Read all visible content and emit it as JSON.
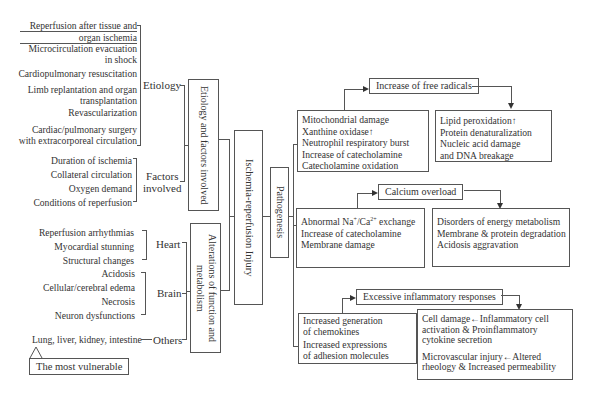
{
  "etiology": {
    "label": "Etiology",
    "items": [
      [
        "Reperfusion after tissue and",
        "organ ischemia"
      ],
      [
        "Microcirculation evacuation",
        "in shock"
      ],
      [
        "Cardiopulmonary resuscitation"
      ],
      [
        "Limb replantation and organ",
        "transplantation"
      ],
      [
        "Revascularization"
      ],
      [
        "Cardiac/pulmonary surgery",
        "with extracorporeal circulation"
      ]
    ]
  },
  "factors": {
    "label_line1": "Factors",
    "label_line2": "involved",
    "items": [
      "Duration of ischemia",
      "Collateral circulation",
      "Oxygen demand",
      "Conditions of reperfusion"
    ]
  },
  "heart": {
    "label": "Heart",
    "items": [
      "Reperfusion arrhythmias",
      "Myocardial stunning",
      "Structural changes"
    ]
  },
  "brain": {
    "label": "Brain",
    "items": [
      "Acidosis",
      "Cellular/cerebral edema",
      "Necrosis",
      "Neuron dysfunctions"
    ]
  },
  "others": {
    "label": "Others",
    "item": "Lung, liver, kidney, intestine",
    "callout": "The most vulnerable"
  },
  "boxes": {
    "etiology_factors": "Etiology and factors involved",
    "alterations": "Alterations of function and metabolism",
    "main": "Ischemia-reperfusion Injury",
    "pathogenesis": "Pathogenesis"
  },
  "free_radicals": {
    "title": "Increase of free radicals",
    "causes": [
      "Mitochondrial damage",
      "Xanthine oxidase↑",
      "Neutrophil respiratory burst",
      "Increase of catecholamine",
      "Catecholamine oxidation"
    ],
    "effects": [
      "Lipid peroxidation↑",
      "Protein denaturalization",
      "Nucleic acid damage",
      "and DNA breakage"
    ]
  },
  "calcium": {
    "title": "Calcium overload",
    "causes": [
      "Abnormal Na⁺/Ca²⁺ exchange",
      "Increase of catecholamine",
      "Membrane damage"
    ],
    "effects": [
      "Disorders of energy metabolism",
      "Membrane & protein degradation",
      "Acidosis aggravation"
    ]
  },
  "inflammation": {
    "title": "Excessive inflammatory responses",
    "causes": [
      "Increased generation",
      "of chemokines",
      "Increased expressions",
      "of adhesion molecules"
    ],
    "effects": [
      "Cell damage←Inflammatory cell",
      "activation & Proinflammatory",
      "cytokine secretion",
      "Microvascular injury←Altered",
      "rheology & Increased permeability"
    ]
  }
}
